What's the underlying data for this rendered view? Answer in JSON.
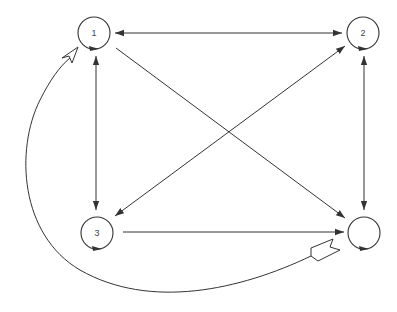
{
  "diagram": {
    "type": "directed-graph",
    "colors": {
      "stroke": "#333333",
      "label": "#444444",
      "background": "#ffffff"
    },
    "nodes": [
      {
        "id": "n1",
        "label": "1",
        "cx": 94,
        "cy": 33,
        "r": 16,
        "self_loop": true
      },
      {
        "id": "n2",
        "label": "2",
        "cx": 363,
        "cy": 33,
        "r": 16,
        "self_loop": true
      },
      {
        "id": "n3",
        "label": "3",
        "cx": 97,
        "cy": 233,
        "r": 16,
        "self_loop": true
      },
      {
        "id": "n4",
        "label": "",
        "cx": 364,
        "cy": 233,
        "r": 16,
        "self_loop": true
      }
    ],
    "edges": [
      {
        "from": "n1",
        "to": "n2",
        "bidirectional": true
      },
      {
        "from": "n1",
        "to": "n3",
        "bidirectional": true
      },
      {
        "from": "n2",
        "to": "n4",
        "bidirectional": true
      },
      {
        "from": "n2",
        "to": "n3",
        "bidirectional": true
      },
      {
        "from": "n1",
        "to": "n4",
        "bidirectional": false
      },
      {
        "from": "n3",
        "to": "n4",
        "bidirectional": false
      },
      {
        "from": "n4",
        "to": "n1",
        "curved": true,
        "head": "open-arrow",
        "tail": "fletch"
      }
    ]
  }
}
